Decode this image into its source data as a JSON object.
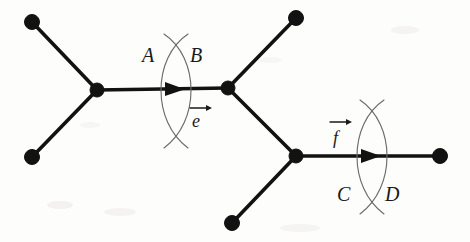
{
  "figure": {
    "background_color": "#fdfdfc",
    "ink_color": "#121212",
    "cut_color": "#6b6b6b",
    "labels": {
      "cut1_left": "A",
      "cut1_right": "B",
      "cut2_left": "C",
      "cut2_right": "D",
      "edge1_vector": "e",
      "edge2_vector": "f"
    },
    "nodes": [
      {
        "id": "leaf-top-left",
        "x": 32,
        "y": 22,
        "r": 7.5,
        "kind": "leaf"
      },
      {
        "id": "leaf-bottom-left",
        "x": 32,
        "y": 157,
        "r": 7.5,
        "kind": "leaf"
      },
      {
        "id": "vertex-left",
        "x": 97,
        "y": 90,
        "r": 7.0,
        "kind": "internal"
      },
      {
        "id": "vertex-middle",
        "x": 228,
        "y": 88,
        "r": 7.0,
        "kind": "internal"
      },
      {
        "id": "leaf-top-right",
        "x": 296,
        "y": 18,
        "r": 7.5,
        "kind": "leaf"
      },
      {
        "id": "vertex-lower",
        "x": 296,
        "y": 156,
        "r": 7.0,
        "kind": "internal"
      },
      {
        "id": "leaf-bottom",
        "x": 232,
        "y": 223,
        "r": 7.5,
        "kind": "leaf"
      },
      {
        "id": "leaf-right",
        "x": 440,
        "y": 156,
        "r": 7.5,
        "kind": "leaf"
      }
    ],
    "edges": [
      {
        "id": "edge-topleft",
        "from": "leaf-top-left",
        "to": "vertex-left"
      },
      {
        "id": "edge-bottomleft",
        "from": "leaf-bottom-left",
        "to": "vertex-left"
      },
      {
        "id": "edge-e",
        "from": "vertex-left",
        "to": "vertex-middle",
        "label": "e",
        "directed": true
      },
      {
        "id": "edge-topright",
        "from": "vertex-middle",
        "to": "leaf-top-right"
      },
      {
        "id": "edge-middle-lower",
        "from": "vertex-middle",
        "to": "vertex-lower"
      },
      {
        "id": "edge-bottom",
        "from": "vertex-lower",
        "to": "leaf-bottom"
      },
      {
        "id": "edge-f",
        "from": "vertex-lower",
        "to": "leaf-right",
        "label": "f",
        "directed": true
      }
    ],
    "cuts": [
      {
        "id": "cut-e",
        "on_edge": "edge-e",
        "center_x": 176,
        "center_y": 90,
        "top_y": 36,
        "bottom_y": 146,
        "bulge": 18,
        "left_label": "A",
        "right_label": "B",
        "left_label_x": 145,
        "left_label_y": 57,
        "right_label_x": 191,
        "right_label_y": 57
      },
      {
        "id": "cut-f",
        "on_edge": "edge-f",
        "center_x": 372,
        "center_y": 156,
        "top_y": 102,
        "bottom_y": 212,
        "bulge": 18,
        "left_label": "C",
        "right_label": "D",
        "left_label_x": 341,
        "left_label_y": 199,
        "right_label_x": 387,
        "right_label_y": 199
      }
    ],
    "arrows": [
      {
        "id": "arrow-e",
        "x": 178,
        "y": 89,
        "direction": "right"
      },
      {
        "id": "arrow-f",
        "x": 374,
        "y": 156,
        "direction": "right"
      }
    ],
    "vector_labels": [
      {
        "id": "vec-e",
        "text": "e",
        "x": 193,
        "y": 123
      },
      {
        "id": "vec-f",
        "text": "f",
        "x": 334,
        "y": 140
      }
    ]
  }
}
